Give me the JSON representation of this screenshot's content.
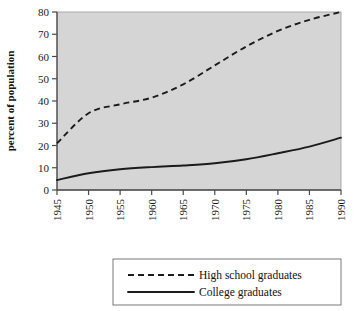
{
  "chart_data": {
    "type": "line",
    "title": "",
    "subtitle": "",
    "xlabel": "",
    "ylabel": "percent of population",
    "xlim": [
      1945,
      1990
    ],
    "ylim": [
      0,
      80
    ],
    "grid": false,
    "legend_position": "bottom",
    "x": [
      1945,
      1950,
      1955,
      1960,
      1965,
      1970,
      1975,
      1980,
      1985,
      1990
    ],
    "xtick_labels": [
      "1945",
      "1950",
      "1955",
      "1960",
      "1965",
      "1970",
      "1975",
      "1980",
      "1985",
      "1990"
    ],
    "ytick_labels": [
      "0",
      "10",
      "20",
      "30",
      "40",
      "50",
      "60",
      "70",
      "80"
    ],
    "yticks": [
      0,
      10,
      20,
      30,
      40,
      50,
      60,
      70,
      80
    ],
    "series": [
      {
        "name": "High school graduates",
        "style": "dashed",
        "color": "#1b1b1b",
        "values": [
          21,
          34.5,
          38.5,
          41.5,
          47.5,
          56,
          64.5,
          71.5,
          76.5,
          80
        ]
      },
      {
        "name": "College graduates",
        "style": "solid",
        "color": "#1b1b1b",
        "values": [
          4.5,
          7.5,
          9.3,
          10.3,
          11,
          12,
          13.8,
          16.5,
          19.5,
          23.5
        ]
      }
    ]
  },
  "legend": {
    "entries": [
      {
        "label": "High school graduates",
        "style": "dashed"
      },
      {
        "label": "College graduates",
        "style": "solid"
      }
    ]
  },
  "colors": {
    "plot_background": "#d5d5d5",
    "page_background": "#ffffff",
    "line": "#1b1b1b",
    "axis": "#4a4a4a"
  }
}
